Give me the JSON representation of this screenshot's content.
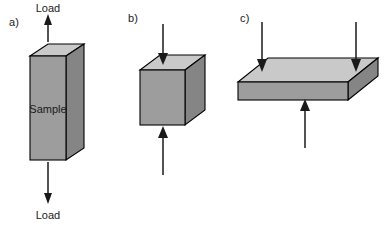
{
  "figure": {
    "background_color": "#ffffff",
    "stroke_color": "#000000",
    "top_face_color": "#c9c9c9",
    "front_face_color": "#9d9d9d",
    "side_face_color": "#858585",
    "arrow_color": "#1a1a1a"
  },
  "panels": [
    {
      "id": "a",
      "label": "a)",
      "test_type": "tension",
      "body_shape": "rectangular-prism",
      "specimen_label": "Sample",
      "arrows": [
        {
          "name": "top-load-arrow",
          "direction": "up",
          "label": "Load"
        },
        {
          "name": "bottom-load-arrow",
          "direction": "down",
          "label": "Load"
        }
      ]
    },
    {
      "id": "b",
      "label": "b)",
      "test_type": "compression",
      "body_shape": "cube",
      "specimen_label": "",
      "arrows": [
        {
          "name": "top-load-arrow",
          "direction": "down",
          "label": ""
        },
        {
          "name": "bottom-load-arrow",
          "direction": "up",
          "label": ""
        }
      ]
    },
    {
      "id": "c",
      "label": "c)",
      "test_type": "three-point-bending",
      "body_shape": "slab",
      "specimen_label": "",
      "arrows": [
        {
          "name": "top-left-load-arrow",
          "direction": "down",
          "label": ""
        },
        {
          "name": "top-right-load-arrow",
          "direction": "down",
          "label": ""
        },
        {
          "name": "bottom-center-support-arrow",
          "direction": "up",
          "label": ""
        }
      ]
    }
  ],
  "labels": {
    "panel_a": "a)",
    "panel_b": "b)",
    "panel_c": "c)",
    "load_top": "Load",
    "load_bottom": "Load",
    "sample": "Sample"
  }
}
